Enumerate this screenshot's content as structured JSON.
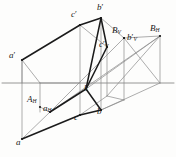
{
  "figure": {
    "background": "#fdfdfc",
    "colors": {
      "heavy_line": "#1b1b1b",
      "thin_line": "#8a8a8a",
      "ground_line": "#6f6f6f",
      "label_text": "#1a1a1a"
    },
    "ground_line": {
      "y": 83,
      "x_start": 2,
      "x_end": 174
    }
  },
  "points": [
    {
      "id": "a_prime",
      "label": "a",
      "prime": true,
      "sub": "",
      "x": 22,
      "y": 60,
      "lx": 9,
      "ly": 51
    },
    {
      "id": "c_prime",
      "label": "c",
      "prime": true,
      "sub": "",
      "x": 80,
      "y": 25,
      "lx": 71,
      "ly": 10
    },
    {
      "id": "b_prime",
      "label": "b",
      "prime": true,
      "sub": "",
      "x": 101,
      "y": 18,
      "lx": 97,
      "ly": 3
    },
    {
      "id": "B_V",
      "label": "B",
      "prime": false,
      "sub": "V",
      "x": 124,
      "y": 38,
      "lx": 112,
      "ly": 26
    },
    {
      "id": "b_prime_V",
      "label": "b",
      "prime": true,
      "sub": "V",
      "x": 124,
      "y": 38,
      "lx": 127,
      "ly": 33
    },
    {
      "id": "c_prime_V",
      "label": "c",
      "prime": true,
      "sub": "V",
      "x": 107,
      "y": 47,
      "lx": 99,
      "ly": 40
    },
    {
      "id": "B_H",
      "label": "B",
      "prime": false,
      "sub": "H",
      "x": 160,
      "y": 36,
      "lx": 150,
      "ly": 24
    },
    {
      "id": "A_H",
      "label": "A",
      "prime": false,
      "sub": "H",
      "x": 40,
      "y": 107,
      "lx": 27,
      "ly": 95
    },
    {
      "id": "a_H",
      "label": "a",
      "prime": false,
      "sub": "H",
      "x": 50,
      "y": 112,
      "lx": 43,
      "ly": 104
    },
    {
      "id": "k",
      "label": "k",
      "prime": false,
      "sub": "",
      "x": 86,
      "y": 89,
      "lx": 84,
      "ly": 84
    },
    {
      "id": "c_bottom",
      "label": "c",
      "prime": false,
      "sub": "",
      "x": 80,
      "y": 115,
      "lx": 74,
      "ly": 113
    },
    {
      "id": "b_bottom",
      "label": "b",
      "prime": false,
      "sub": "",
      "x": 101,
      "y": 110,
      "lx": 97,
      "ly": 107
    },
    {
      "id": "a_bottom",
      "label": "a",
      "prime": false,
      "sub": "",
      "x": 22,
      "y": 139,
      "lx": 16,
      "ly": 138
    }
  ],
  "segments": {
    "heavy": [
      {
        "name": "a-prime-to-c-prime",
        "x1": 22,
        "y1": 60,
        "x2": 80,
        "y2": 25
      },
      {
        "name": "c-prime-to-b-prime",
        "x1": 80,
        "y1": 25,
        "x2": 101,
        "y2": 18
      },
      {
        "name": "b-prime-to-k",
        "x1": 101,
        "y1": 18,
        "x2": 86,
        "y2": 89
      },
      {
        "name": "k-to-c-prime-V",
        "x1": 86,
        "y1": 89,
        "x2": 107,
        "y2": 47
      },
      {
        "name": "c-prime-V-to-b-prime",
        "x1": 107,
        "y1": 47,
        "x2": 101,
        "y2": 18
      },
      {
        "name": "a-bottom-to-c-bottom",
        "x1": 22,
        "y1": 139,
        "x2": 80,
        "y2": 115
      },
      {
        "name": "c-bottom-to-b-bottom",
        "x1": 80,
        "y1": 115,
        "x2": 101,
        "y2": 110
      },
      {
        "name": "a-H-to-k",
        "x1": 50,
        "y1": 112,
        "x2": 86,
        "y2": 89
      },
      {
        "name": "k-to-b-bottom-area",
        "x1": 86,
        "y1": 89,
        "x2": 101,
        "y2": 110
      }
    ],
    "thin": [
      {
        "name": "ground-line",
        "x1": 2,
        "y1": 83,
        "x2": 174,
        "y2": 83
      },
      {
        "name": "a-prime-vertical",
        "x1": 22,
        "y1": 60,
        "x2": 22,
        "y2": 139
      },
      {
        "name": "c-prime-vertical",
        "x1": 80,
        "y1": 25,
        "x2": 80,
        "y2": 115
      },
      {
        "name": "b-prime-vertical",
        "x1": 101,
        "y1": 18,
        "x2": 101,
        "y2": 110
      },
      {
        "name": "B-V-vertical",
        "x1": 124,
        "y1": 38,
        "x2": 124,
        "y2": 100
      },
      {
        "name": "c-prime-V-vertical",
        "x1": 107,
        "y1": 47,
        "x2": 107,
        "y2": 96
      },
      {
        "name": "B-H-vertical",
        "x1": 160,
        "y1": 36,
        "x2": 160,
        "y2": 83
      },
      {
        "name": "A-H-vertical",
        "x1": 40,
        "y1": 83,
        "x2": 40,
        "y2": 112
      },
      {
        "name": "a-prime-to-A-H",
        "x1": 22,
        "y1": 60,
        "x2": 40,
        "y2": 83
      },
      {
        "name": "A-H-left-edge",
        "x1": 22,
        "y1": 60,
        "x2": 22,
        "y2": 83
      },
      {
        "name": "a-prime-quad-bottom",
        "x1": 40,
        "y1": 83,
        "x2": 80,
        "y2": 83
      },
      {
        "name": "a-bottom-to-a-H",
        "x1": 22,
        "y1": 139,
        "x2": 50,
        "y2": 112
      },
      {
        "name": "a-H-to-A-H",
        "x1": 50,
        "y1": 112,
        "x2": 40,
        "y2": 107
      },
      {
        "name": "a-H-to-c-prime-V-ray",
        "x1": 50,
        "y1": 112,
        "x2": 124,
        "y2": 38
      },
      {
        "name": "c-prime-to-c-prime-V",
        "x1": 80,
        "y1": 25,
        "x2": 107,
        "y2": 47
      },
      {
        "name": "b-prime-to-B-V",
        "x1": 101,
        "y1": 18,
        "x2": 124,
        "y2": 38
      },
      {
        "name": "B-V-to-B-H-upper",
        "x1": 124,
        "y1": 38,
        "x2": 160,
        "y2": 36
      },
      {
        "name": "B-V-to-ground-right",
        "x1": 124,
        "y1": 38,
        "x2": 160,
        "y2": 83
      },
      {
        "name": "B-H-to-ground-left",
        "x1": 160,
        "y1": 36,
        "x2": 107,
        "y2": 96
      },
      {
        "name": "B-H-to-k-ray",
        "x1": 160,
        "y1": 36,
        "x2": 86,
        "y2": 89
      },
      {
        "name": "b-bottom-to-B-H-ground",
        "x1": 101,
        "y1": 110,
        "x2": 160,
        "y2": 83
      },
      {
        "name": "c-bottom-to-c-V-vert",
        "x1": 80,
        "y1": 115,
        "x2": 107,
        "y2": 96
      },
      {
        "name": "b-bottom-to-B-V-vert",
        "x1": 101,
        "y1": 110,
        "x2": 124,
        "y2": 100
      },
      {
        "name": "lower-parallel-c-to-B",
        "x1": 107,
        "y1": 96,
        "x2": 124,
        "y2": 100
      },
      {
        "name": "a-H-to-B-H-long-ray",
        "x1": 50,
        "y1": 112,
        "x2": 160,
        "y2": 36
      }
    ]
  }
}
